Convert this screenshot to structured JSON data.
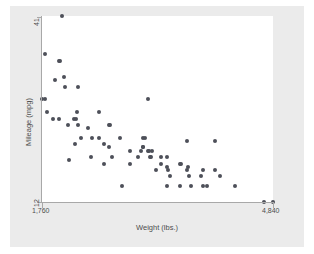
{
  "chart_data": {
    "type": "scatter",
    "title": "",
    "xlabel": "Weight (lbs.)",
    "ylabel": "Mileage (mpg)",
    "xlim": [
      1760,
      4840
    ],
    "ylim": [
      12,
      41
    ],
    "xticks": [
      1760,
      4840
    ],
    "xtick_labels": [
      "1,760",
      "4,840"
    ],
    "yticks": [
      12,
      41
    ],
    "ytick_labels": [
      "12",
      "41"
    ],
    "grid": false,
    "legend": false,
    "marker_color": "#4d5059",
    "marker_shape": "circle",
    "plot_background": "#ffffff",
    "graph_background": "#ebebeb",
    "axis_color": "#a8a8a8",
    "n_points": 74,
    "points": [
      {
        "x": 2020,
        "y": 41
      },
      {
        "x": 1800,
        "y": 35
      },
      {
        "x": 1980,
        "y": 34
      },
      {
        "x": 2000,
        "y": 34
      },
      {
        "x": 1930,
        "y": 31
      },
      {
        "x": 2070,
        "y": 30
      },
      {
        "x": 2050,
        "y": 31.5
      },
      {
        "x": 2240,
        "y": 30
      },
      {
        "x": 1760,
        "y": 28
      },
      {
        "x": 1800,
        "y": 28
      },
      {
        "x": 3170,
        "y": 28
      },
      {
        "x": 1830,
        "y": 26
      },
      {
        "x": 2230,
        "y": 26
      },
      {
        "x": 2520,
        "y": 26
      },
      {
        "x": 1910,
        "y": 25
      },
      {
        "x": 1980,
        "y": 25
      },
      {
        "x": 2190,
        "y": 25
      },
      {
        "x": 2210,
        "y": 25
      },
      {
        "x": 2650,
        "y": 24
      },
      {
        "x": 2670,
        "y": 24
      },
      {
        "x": 2110,
        "y": 24
      },
      {
        "x": 2240,
        "y": 24
      },
      {
        "x": 2370,
        "y": 23.5
      },
      {
        "x": 2280,
        "y": 22
      },
      {
        "x": 2430,
        "y": 22
      },
      {
        "x": 2520,
        "y": 22
      },
      {
        "x": 2800,
        "y": 22
      },
      {
        "x": 3100,
        "y": 22
      },
      {
        "x": 3130,
        "y": 22
      },
      {
        "x": 3690,
        "y": 21.5
      },
      {
        "x": 4060,
        "y": 21.5
      },
      {
        "x": 2200,
        "y": 21
      },
      {
        "x": 2580,
        "y": 21
      },
      {
        "x": 2650,
        "y": 20.5
      },
      {
        "x": 3100,
        "y": 20.5
      },
      {
        "x": 3110,
        "y": 20.5
      },
      {
        "x": 2930,
        "y": 20
      },
      {
        "x": 3080,
        "y": 20
      },
      {
        "x": 3170,
        "y": 20
      },
      {
        "x": 3180,
        "y": 20
      },
      {
        "x": 3220,
        "y": 20
      },
      {
        "x": 2410,
        "y": 19
      },
      {
        "x": 2690,
        "y": 19
      },
      {
        "x": 3040,
        "y": 19
      },
      {
        "x": 3200,
        "y": 19
      },
      {
        "x": 3210,
        "y": 19
      },
      {
        "x": 3350,
        "y": 19
      },
      {
        "x": 3420,
        "y": 19
      },
      {
        "x": 2120,
        "y": 18.5
      },
      {
        "x": 2930,
        "y": 18
      },
      {
        "x": 3350,
        "y": 18
      },
      {
        "x": 3600,
        "y": 18
      },
      {
        "x": 3610,
        "y": 18
      },
      {
        "x": 2580,
        "y": 18
      },
      {
        "x": 3430,
        "y": 17.5
      },
      {
        "x": 3700,
        "y": 17.5
      },
      {
        "x": 3280,
        "y": 17
      },
      {
        "x": 3440,
        "y": 17
      },
      {
        "x": 3690,
        "y": 17
      },
      {
        "x": 3900,
        "y": 17
      },
      {
        "x": 4060,
        "y": 17
      },
      {
        "x": 3470,
        "y": 16
      },
      {
        "x": 3720,
        "y": 16
      },
      {
        "x": 3880,
        "y": 16
      },
      {
        "x": 4130,
        "y": 16
      },
      {
        "x": 2830,
        "y": 14.5
      },
      {
        "x": 3420,
        "y": 14.5
      },
      {
        "x": 3600,
        "y": 14.5
      },
      {
        "x": 3740,
        "y": 14.5
      },
      {
        "x": 3900,
        "y": 14.5
      },
      {
        "x": 3960,
        "y": 14.5
      },
      {
        "x": 4330,
        "y": 14.5
      },
      {
        "x": 4720,
        "y": 12
      },
      {
        "x": 4840,
        "y": 12
      }
    ]
  }
}
